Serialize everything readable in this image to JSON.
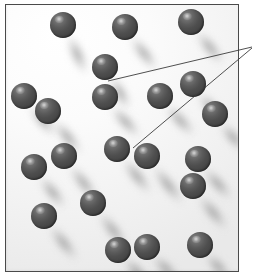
{
  "figure": {
    "kind": "scientific-illustration",
    "caption": "",
    "colors": {
      "background": "#ffffff",
      "vessel_fill_light": "#ffffff",
      "vessel_fill_dark": "#e9e9e9",
      "vessel_border": "#4a4a4a",
      "particle_dark": "#343434",
      "particle_mid": "#4e4e4e",
      "particle_highlight": "#d7d7d7",
      "shadow": "#787878",
      "leader_line": "#3c3c3c"
    },
    "vessel": {
      "x": 5,
      "y": 4,
      "width": 234,
      "height": 268,
      "border_width": 1
    },
    "particles": [
      {
        "id": "p01",
        "cx": 62,
        "cy": 24,
        "r": 13
      },
      {
        "id": "p02",
        "cx": 124,
        "cy": 26,
        "r": 13
      },
      {
        "id": "p03",
        "cx": 190,
        "cy": 21,
        "r": 13
      },
      {
        "id": "p04",
        "cx": 104,
        "cy": 66,
        "r": 13
      },
      {
        "id": "p05",
        "cx": 192,
        "cy": 83,
        "r": 13
      },
      {
        "id": "p06",
        "cx": 23,
        "cy": 95,
        "r": 13
      },
      {
        "id": "p07",
        "cx": 104,
        "cy": 96,
        "r": 13
      },
      {
        "id": "p08",
        "cx": 159,
        "cy": 95,
        "r": 13
      },
      {
        "id": "p09",
        "cx": 47,
        "cy": 110,
        "r": 13
      },
      {
        "id": "p10",
        "cx": 214,
        "cy": 113,
        "r": 13
      },
      {
        "id": "p11",
        "cx": 116,
        "cy": 148,
        "r": 13
      },
      {
        "id": "p12",
        "cx": 146,
        "cy": 155,
        "r": 13
      },
      {
        "id": "p13",
        "cx": 63,
        "cy": 155,
        "r": 13
      },
      {
        "id": "p14",
        "cx": 33,
        "cy": 166,
        "r": 13
      },
      {
        "id": "p15",
        "cx": 197,
        "cy": 158,
        "r": 13
      },
      {
        "id": "p16",
        "cx": 192,
        "cy": 185,
        "r": 13
      },
      {
        "id": "p17",
        "cx": 92,
        "cy": 202,
        "r": 13
      },
      {
        "id": "p18",
        "cx": 43,
        "cy": 215,
        "r": 13
      },
      {
        "id": "p19",
        "cx": 117,
        "cy": 249,
        "r": 13
      },
      {
        "id": "p20",
        "cx": 146,
        "cy": 246,
        "r": 13
      },
      {
        "id": "p21",
        "cx": 199,
        "cy": 244,
        "r": 13
      }
    ],
    "shadows": [
      {
        "for": "p01",
        "x1": 68,
        "y1": 33,
        "x2": 80,
        "y2": 60
      },
      {
        "for": "p02",
        "x1": 130,
        "y1": 35,
        "x2": 148,
        "y2": 58
      },
      {
        "for": "p03",
        "x1": 196,
        "y1": 30,
        "x2": 214,
        "y2": 52
      },
      {
        "for": "p04",
        "x1": 110,
        "y1": 75,
        "x2": 122,
        "y2": 96
      },
      {
        "for": "p05",
        "x1": 198,
        "y1": 92,
        "x2": 214,
        "y2": 110
      },
      {
        "for": "p06",
        "x1": 29,
        "y1": 104,
        "x2": 46,
        "y2": 124
      },
      {
        "for": "p07",
        "x1": 110,
        "y1": 105,
        "x2": 130,
        "y2": 126
      },
      {
        "for": "p08",
        "x1": 165,
        "y1": 104,
        "x2": 184,
        "y2": 124
      },
      {
        "for": "p09",
        "x1": 53,
        "y1": 119,
        "x2": 72,
        "y2": 142
      },
      {
        "for": "p10",
        "x1": 220,
        "y1": 122,
        "x2": 236,
        "y2": 140
      },
      {
        "for": "p11",
        "x1": 122,
        "y1": 157,
        "x2": 142,
        "y2": 182
      },
      {
        "for": "p12",
        "x1": 152,
        "y1": 164,
        "x2": 174,
        "y2": 192
      },
      {
        "for": "p13",
        "x1": 69,
        "y1": 164,
        "x2": 88,
        "y2": 188
      },
      {
        "for": "p14",
        "x1": 39,
        "y1": 175,
        "x2": 56,
        "y2": 196
      },
      {
        "for": "p15",
        "x1": 203,
        "y1": 167,
        "x2": 222,
        "y2": 188
      },
      {
        "for": "p16",
        "x1": 198,
        "y1": 194,
        "x2": 218,
        "y2": 218
      },
      {
        "for": "p17",
        "x1": 98,
        "y1": 211,
        "x2": 118,
        "y2": 236
      },
      {
        "for": "p18",
        "x1": 49,
        "y1": 224,
        "x2": 68,
        "y2": 248
      },
      {
        "for": "p19",
        "x1": 123,
        "y1": 258,
        "x2": 138,
        "y2": 272
      },
      {
        "for": "p20",
        "x1": 152,
        "y1": 255,
        "x2": 168,
        "y2": 270
      },
      {
        "for": "p21",
        "x1": 205,
        "y1": 253,
        "x2": 220,
        "y2": 268
      }
    ],
    "leader_lines": [
      {
        "id": "leader-upper",
        "x1": 108,
        "y1": 81,
        "x2": 252,
        "y2": 47,
        "label": ""
      },
      {
        "id": "leader-lower",
        "x1": 133,
        "y1": 148,
        "x2": 252,
        "y2": 48,
        "label": ""
      }
    ],
    "annotation_label": ""
  }
}
